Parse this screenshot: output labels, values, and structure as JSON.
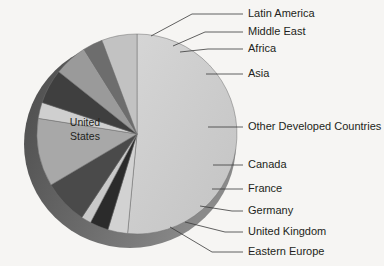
{
  "chart_data": {
    "type": "pie",
    "title": "",
    "center_label": "United States",
    "center_label_lines": [
      "United",
      "States"
    ],
    "legend_position": "callout-labels",
    "total_degrees": 360,
    "start_angle_deg": -90,
    "direction": "clockwise",
    "slices": [
      {
        "label": "United States",
        "value": 51.5,
        "color": "#cfcfcf",
        "label_placement": "center"
      },
      {
        "label": "Latin America",
        "value": 3.2,
        "color": "#d2d2d2",
        "label_placement": "callout"
      },
      {
        "label": "Middle East",
        "value": 3.0,
        "color": "#2b2b2b",
        "label_placement": "callout"
      },
      {
        "label": "Africa",
        "value": 1.6,
        "color": "#c9c9c9",
        "label_placement": "callout"
      },
      {
        "label": "Asia",
        "value": 7.2,
        "color": "#4a4a4a",
        "label_placement": "callout"
      },
      {
        "label": "Other Developed Countries",
        "value": 11.0,
        "color": "#a8a8a8",
        "label_placement": "callout"
      },
      {
        "label": "Canada",
        "value": 2.6,
        "color": "#cfcfcf",
        "label_placement": "callout"
      },
      {
        "label": "France",
        "value": 5.6,
        "color": "#3f3f3f",
        "label_placement": "callout"
      },
      {
        "label": "Germany",
        "value": 5.4,
        "color": "#9a9a9a",
        "label_placement": "callout"
      },
      {
        "label": "United Kingdom",
        "value": 3.2,
        "color": "#6d6d6d",
        "label_placement": "callout"
      },
      {
        "label": "Eastern Europe",
        "value": 5.7,
        "color": "#c2c2c2",
        "label_placement": "callout"
      }
    ],
    "labels": [
      "Latin America",
      "Middle East",
      "Africa",
      "Asia",
      "Other Developed Countries",
      "Canada",
      "France",
      "Germany",
      "United Kingdom",
      "Eastern Europe"
    ],
    "colors": {
      "background": "#f6f5f3",
      "depth_shadow": "#5c5c5c",
      "outline": "#6f6f6f",
      "text": "#231f20",
      "leader_line": "#3a3a3a"
    }
  },
  "labels": {
    "latin_america": "Latin America",
    "middle_east": "Middle East",
    "africa": "Africa",
    "asia": "Asia",
    "other_developed": "Other Developed Countries",
    "canada": "Canada",
    "france": "France",
    "germany": "Germany",
    "united_kingdom": "United Kingdom",
    "eastern_europe": "Eastern Europe",
    "united_states_line1": "United",
    "united_states_line2": "States"
  }
}
